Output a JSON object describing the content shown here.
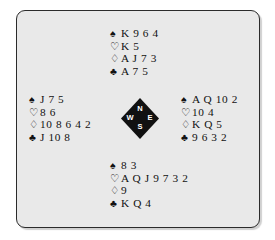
{
  "diagram": {
    "type": "bridge-deal",
    "suit_symbols": {
      "spade": "♠",
      "heart": "♡",
      "diamond": "♢",
      "club": "♣"
    },
    "compass": {
      "north": "N",
      "south": "S",
      "west": "W",
      "east": "E"
    },
    "colors": {
      "background": "#e9e9e9",
      "page": "#ffffff",
      "ink": "#111111",
      "border": "#2b2b2b",
      "compass_fill": "#111111",
      "compass_text": "#ffffff"
    },
    "hands": {
      "north": {
        "label": "North",
        "spades": "K 9 6 4",
        "hearts": "K 5",
        "diamonds": "A J 7 3",
        "clubs": "A 7 5"
      },
      "west": {
        "label": "West",
        "spades": "J 7 5",
        "hearts": "8 6",
        "diamonds": "10 8 6 4 2",
        "clubs": "J 10 8"
      },
      "east": {
        "label": "East",
        "spades": "A Q 10 2",
        "hearts": "10 4",
        "diamonds": "K Q 5",
        "clubs": "9 6 3 2"
      },
      "south": {
        "label": "South",
        "spades": "8 3",
        "hearts": "A Q J 9 7 3 2",
        "diamonds": "9",
        "clubs": "K Q 4"
      }
    }
  }
}
